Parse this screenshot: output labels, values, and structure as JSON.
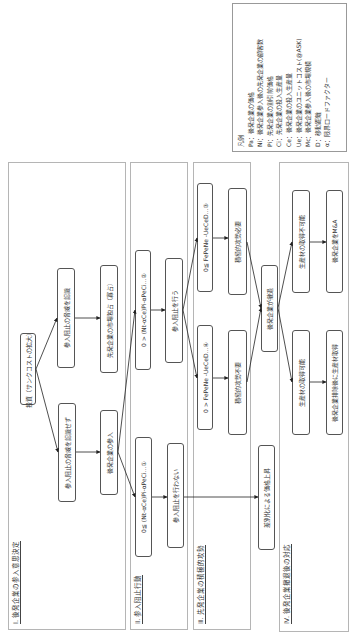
{
  "legend": {
    "title": "凡例",
    "items": [
      "Pa：後発企業の価格",
      "Ni：後発企業参入後の先発企業の顧客数",
      "Pi：先発企業の割引前価格",
      "Ci：先発企業の投入生産量",
      "Ce：後発企業の投入生産量",
      "Ue：後発企業のユニットコスト(@ASK)",
      "Mc：後発企業参入後の市場規模",
      "D：移動距離",
      "α：限界ロードファクター"
    ]
  },
  "sections": {
    "s1": {
      "label": "Ⅰ. 後発企業の参入意思決定",
      "boxes": {
        "invest": "投資（サンクコストの拡大）",
        "recognize": "参入阻止の脅威を認識",
        "not_recognize": "参入阻止の脅威を認識せず",
        "monopoly": "先発企業の市場独占（寡占）",
        "entry": "後発企業の参入"
      }
    },
    "s2": {
      "label": "Ⅱ. 参入阻止行動",
      "boxes": {
        "cond2": "0 > (Nt-αCe)Pi-αPeCi…②",
        "cond1": "0≦ (Nt-αCe)Pi-αPeCi…①",
        "deter": "参入阻止を行う",
        "no_deter": "参入阻止を行わない"
      }
    },
    "s3": {
      "label": "Ⅲ. 先発企業の積極的攻勢",
      "boxes": {
        "cond3": "0≦ FePeNe -UeCeD…③",
        "cond4": "0 > FePeNe -UeCeD…④",
        "attack_needed": "積極的攻勢必要",
        "attack_not_needed": "積極的攻勢不要",
        "withdraw": "後発企業が撤退",
        "differentiation": "差別化による価格上昇"
      }
    },
    "s4": {
      "label": "Ⅳ. 後発企業撤退後の対応",
      "boxes": {
        "cannot_acquire": "生産材の取得不可能",
        "ma": "後発企業をM&A",
        "can_acquire": "生産材の取得可能",
        "acquire_after": "後発企業排除後に生産材取得"
      }
    }
  },
  "colors": {
    "border": "#555555",
    "section_border": "#b5b5b5",
    "arrow": "#222222",
    "text": "#333333"
  }
}
